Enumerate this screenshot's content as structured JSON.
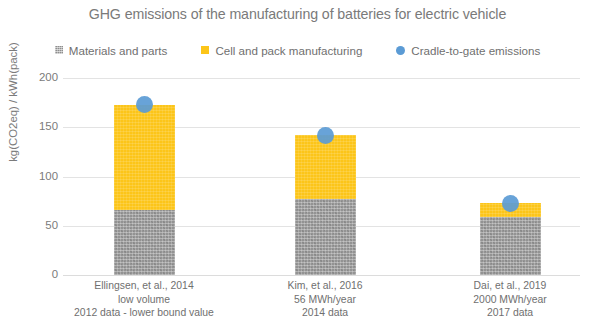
{
  "chart_data": {
    "type": "bar",
    "subtype": "stacked-bar-with-scatter-overlay",
    "title": "GHG emissions of the manufacturing of batteries for electric vehicle",
    "xlabel": "",
    "ylabel": "kg(CO2eq) / kWh(pack)",
    "ylim": [
      0,
      200
    ],
    "yticks": [
      0,
      50,
      100,
      150,
      200
    ],
    "ytick_labels": [
      "0",
      "50",
      "100",
      "150",
      "200"
    ],
    "grid": true,
    "legend_position": "top",
    "categories": [
      "Ellingsen, et al., 2014 low volume 2012 data - lower bound value",
      "Kim, et al., 2016 56 MWh/year 2014 data",
      "Dai, et al., 2019 2000 MWh/year 2017 data"
    ],
    "category_lines": [
      [
        "Ellingsen, et al., 2014",
        "low volume",
        "2012 data - lower bound value"
      ],
      [
        "Kim, et al., 2016",
        "56 MWh/year",
        "2014 data"
      ],
      [
        "Dai, et al., 2019",
        "2000 MWh/year",
        "2017 data"
      ]
    ],
    "series": [
      {
        "name": "Materials and parts",
        "type": "bar",
        "color": "#939393",
        "values": [
          66,
          77,
          59
        ]
      },
      {
        "name": "Cell and pack manufacturing",
        "type": "bar",
        "color": "#FCC519",
        "values": [
          107,
          65,
          14
        ]
      },
      {
        "name": "Cradle-to-gate emissions",
        "type": "scatter",
        "color": "#5B9BD5",
        "values": [
          173,
          142,
          73
        ]
      }
    ],
    "totals": [
      173,
      142,
      73
    ]
  },
  "legend": {
    "items": [
      {
        "label": "Materials and parts",
        "marker": "square-icon",
        "color": "#939393"
      },
      {
        "label": "Cell and pack manufacturing",
        "marker": "square-icon",
        "color": "#FCC519"
      },
      {
        "label": "Cradle-to-gate emissions",
        "marker": "circle-icon",
        "color": "#5B9BD5"
      }
    ]
  },
  "colors": {
    "materials": "#939393",
    "cellpack": "#FCC519",
    "cradle": "#5B9BD5",
    "grid": "#e3e3e3",
    "text": "#6f6f6f",
    "background": "#ffffff"
  }
}
